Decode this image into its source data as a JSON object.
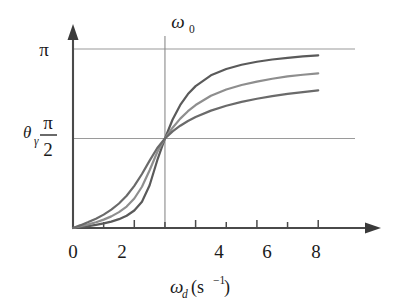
{
  "chart_data": {
    "type": "line",
    "title": "",
    "xlabel": "ω_d (s⁻¹)",
    "ylabel": "θ_γ",
    "xlim": [
      0,
      9.2
    ],
    "ylim": [
      0,
      3.45
    ],
    "grid": true,
    "legend_position": "none",
    "x_ticks": [
      0,
      1,
      2,
      3,
      4,
      5,
      6,
      7,
      8
    ],
    "x_tick_labels": [
      "0",
      "",
      "2",
      "",
      "4",
      "",
      "6",
      "",
      "8"
    ],
    "y_ticks": [
      1.5708,
      3.14159
    ],
    "y_tick_labels": [
      "π/2",
      "π"
    ],
    "annotations": [
      {
        "name": "resonance-marker",
        "label": "ω₀",
        "x": 3.0,
        "type": "vertical-line"
      },
      {
        "name": "pi-gridline",
        "y": 3.14159,
        "type": "horizontal-line"
      },
      {
        "name": "half-pi-gridline",
        "y": 1.5708,
        "type": "horizontal-line"
      }
    ],
    "omega_0": 3.0,
    "x": [
      0,
      0.25,
      0.5,
      0.75,
      1,
      1.25,
      1.5,
      1.75,
      2,
      2.25,
      2.5,
      2.75,
      3,
      3.25,
      3.5,
      3.75,
      4,
      4.5,
      5,
      5.5,
      6,
      6.5,
      7,
      7.5,
      8
    ],
    "series": [
      {
        "name": "low-damping",
        "gamma": 0.45,
        "color": "#5a5a5a",
        "values": [
          0,
          0.016,
          0.034,
          0.055,
          0.08,
          0.112,
          0.155,
          0.215,
          0.307,
          0.462,
          0.75,
          1.19,
          1.571,
          1.904,
          2.16,
          2.35,
          2.49,
          2.68,
          2.79,
          2.865,
          2.918,
          2.957,
          2.987,
          3.011,
          3.03
        ]
      },
      {
        "name": "medium-damping",
        "gamma": 0.85,
        "color": "#8e8e8e",
        "values": [
          0,
          0.031,
          0.064,
          0.101,
          0.147,
          0.204,
          0.278,
          0.377,
          0.518,
          0.724,
          1.013,
          1.334,
          1.571,
          1.76,
          1.92,
          2.05,
          2.158,
          2.32,
          2.43,
          2.51,
          2.57,
          2.62,
          2.66,
          2.69,
          2.715
        ]
      },
      {
        "name": "high-damping",
        "gamma": 1.4,
        "color": "#6a6a6a",
        "values": [
          0,
          0.05,
          0.104,
          0.164,
          0.235,
          0.322,
          0.43,
          0.566,
          0.739,
          0.948,
          1.183,
          1.405,
          1.571,
          1.695,
          1.795,
          1.878,
          1.948,
          2.06,
          2.145,
          2.213,
          2.268,
          2.314,
          2.353,
          2.386,
          2.415
        ]
      }
    ]
  },
  "labels": {
    "y_axis_symbol": "θ",
    "y_axis_subscript": "γ",
    "pi_label": "π",
    "half_pi_numerator": "π",
    "half_pi_denominator": "2",
    "omega_zero_symbol": "ω",
    "omega_zero_subscript": "0",
    "x_axis_symbol": "ω",
    "x_axis_subscript": "d",
    "x_axis_unit_open": "(s",
    "x_axis_unit_exp": "−1",
    "x_axis_unit_close": ")",
    "tick_0": "0",
    "tick_2": "2",
    "tick_4": "4",
    "tick_6": "6",
    "tick_8": "8"
  },
  "colors": {
    "axis": "#4a4a4a",
    "grid": "#9a9a9a",
    "curve_dark": "#5a5a5a",
    "curve_light": "#8e8e8e",
    "curve_mid": "#6a6a6a",
    "background": "#ffffff"
  }
}
